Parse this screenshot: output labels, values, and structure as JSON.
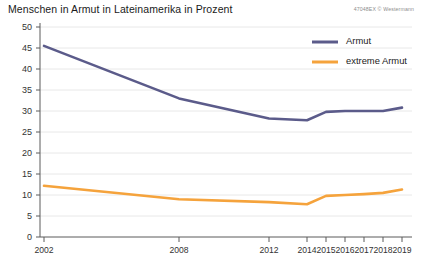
{
  "title": "Menschen in Armut in Lateinamerika in Prozent",
  "credit": "47048EX © Westermann",
  "colors": {
    "armut": "#5b5b8a",
    "extreme_armut": "#f5a33c",
    "grid": "#e2e2e2",
    "axis": "#5a5a5a",
    "text": "#1a1a1a",
    "background": "#ffffff"
  },
  "legend": {
    "position": "top-right",
    "entries": [
      {
        "label": "Armut",
        "color": "#5b5b8a"
      },
      {
        "label": "extreme Armut",
        "color": "#f5a33c"
      }
    ]
  },
  "axes": {
    "y_ticks": [
      "0",
      "5",
      "10",
      "15",
      "20",
      "25",
      "30",
      "35",
      "40",
      "45",
      "50"
    ],
    "x_ticks": [
      "2002",
      "2008",
      "2012",
      "2014",
      "2015",
      "2016",
      "2017",
      "2018",
      "2019"
    ]
  },
  "chart_data": {
    "type": "line",
    "title": "Menschen in Armut in Lateinamerika in Prozent",
    "xlabel": "",
    "ylabel": "",
    "ylim": [
      0,
      50
    ],
    "ytick_step": 5,
    "grid": true,
    "legend_position": "top-right",
    "categories": [
      "2002",
      "2008",
      "2012",
      "2014",
      "2015",
      "2016",
      "2017",
      "2018",
      "2019"
    ],
    "x_positions": [
      2002,
      2008,
      2012,
      2014,
      2015,
      2016,
      2017,
      2018,
      2019
    ],
    "series": [
      {
        "name": "Armut",
        "color": "#5b5b8a",
        "values": [
          45.5,
          33.0,
          28.2,
          27.8,
          29.8,
          30.0,
          30.0,
          30.0,
          30.8
        ]
      },
      {
        "name": "extreme Armut",
        "color": "#f5a33c",
        "values": [
          12.2,
          9.0,
          8.3,
          7.8,
          9.8,
          10.0,
          10.2,
          10.5,
          11.3
        ]
      }
    ]
  }
}
